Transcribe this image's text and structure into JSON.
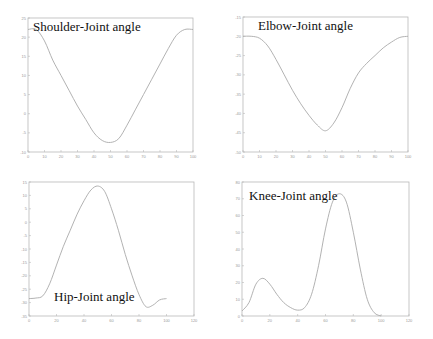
{
  "chart_data": [
    {
      "type": "line",
      "title": "Shoulder-Joint angle",
      "xlabel": "",
      "ylabel": "",
      "xlim": [
        0,
        100
      ],
      "ylim": [
        -10,
        25
      ],
      "xticks": [
        0,
        10,
        20,
        30,
        40,
        50,
        60,
        70,
        80,
        90,
        100
      ],
      "yticks": [
        25,
        20,
        15,
        10,
        5,
        0,
        -5,
        -10
      ],
      "grid": false,
      "legend": "none",
      "box": [
        28,
        18,
        193,
        152
      ],
      "title_pos": [
        33,
        31
      ],
      "x": [
        0,
        5,
        10,
        15,
        20,
        25,
        30,
        35,
        40,
        45,
        50,
        55,
        60,
        65,
        70,
        75,
        80,
        85,
        90,
        95,
        100
      ],
      "values": [
        22,
        22,
        19,
        14,
        10,
        6,
        2,
        -1.5,
        -5,
        -7,
        -7.5,
        -6.5,
        -3,
        1,
        5,
        9,
        13,
        17,
        20.5,
        22,
        22
      ]
    },
    {
      "type": "line",
      "title": "Elbow-Joint angle",
      "xlabel": "",
      "ylabel": "",
      "xlim": [
        0,
        100
      ],
      "ylim": [
        -50,
        -15
      ],
      "xticks": [
        0,
        10,
        20,
        30,
        40,
        50,
        60,
        70,
        80,
        90,
        100
      ],
      "yticks": [
        -15,
        -20,
        -25,
        -30,
        -35,
        -40,
        -45,
        -50
      ],
      "grid": false,
      "legend": "none",
      "box": [
        243,
        17,
        408,
        152
      ],
      "title_pos": [
        258,
        30
      ],
      "x": [
        0,
        5,
        10,
        15,
        20,
        25,
        30,
        35,
        40,
        45,
        50,
        55,
        60,
        65,
        70,
        75,
        80,
        85,
        90,
        95,
        100
      ],
      "values": [
        -20,
        -20,
        -20.5,
        -22.5,
        -26,
        -30,
        -34,
        -37.5,
        -40.5,
        -43,
        -44.5,
        -42.5,
        -38.5,
        -33.5,
        -29.5,
        -27,
        -25,
        -23,
        -21.5,
        -20.3,
        -20
      ]
    },
    {
      "type": "line",
      "title": "Hip-Joint angle",
      "xlabel": "",
      "ylabel": "",
      "xlim": [
        0,
        120
      ],
      "ylim": [
        -35,
        15
      ],
      "xticks": [
        0,
        20,
        40,
        60,
        80,
        100,
        120
      ],
      "yticks": [
        15,
        10,
        5,
        0,
        -5,
        -10,
        -15,
        -20,
        -25,
        -30,
        -35
      ],
      "grid": false,
      "legend": "none",
      "box": [
        29,
        182,
        194,
        316
      ],
      "title_pos": [
        54,
        301
      ],
      "x": [
        0,
        5,
        10,
        15,
        20,
        25,
        30,
        35,
        40,
        45,
        50,
        55,
        60,
        65,
        70,
        75,
        80,
        85,
        90,
        95,
        100
      ],
      "values": [
        -28.5,
        -28.3,
        -27.5,
        -23,
        -16,
        -9,
        -3,
        3,
        8,
        12,
        13.5,
        11.5,
        5,
        -3,
        -12,
        -20,
        -27,
        -31.5,
        -31,
        -29,
        -28.5
      ]
    },
    {
      "type": "line",
      "title": "Knee-Joint angle",
      "xlabel": "",
      "ylabel": "",
      "xlim": [
        0,
        120
      ],
      "ylim": [
        0,
        80
      ],
      "xticks": [
        0,
        20,
        40,
        60,
        80,
        100,
        120
      ],
      "yticks": [
        80,
        70,
        60,
        50,
        40,
        30,
        20,
        10,
        0
      ],
      "grid": false,
      "legend": "none",
      "box": [
        242,
        182,
        409,
        316
      ],
      "title_pos": [
        249,
        200
      ],
      "x": [
        0,
        5,
        10,
        15,
        20,
        25,
        30,
        35,
        40,
        45,
        50,
        55,
        60,
        65,
        70,
        75,
        80,
        85,
        90,
        95,
        100
      ],
      "values": [
        3,
        8,
        19,
        22.5,
        19,
        13,
        8,
        5,
        3.5,
        5,
        13,
        30,
        52,
        68,
        73,
        68,
        50,
        28,
        10,
        2,
        0
      ]
    }
  ]
}
